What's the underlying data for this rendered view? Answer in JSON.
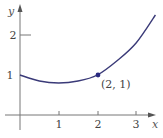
{
  "chart_data": {
    "type": "line",
    "title": "",
    "xlabel": "x",
    "ylabel": "y",
    "x_ticks": [
      "1",
      "2",
      "3"
    ],
    "y_ticks": [
      "1",
      "2"
    ],
    "xlim": [
      0,
      3.7
    ],
    "ylim": [
      0,
      2.6
    ],
    "grid": false,
    "series": [
      {
        "name": "curve",
        "x": [
          0,
          0.5,
          1,
          1.5,
          2,
          2.5,
          3,
          3.5
        ],
        "y": [
          1,
          0.85,
          0.8,
          0.85,
          1,
          1.35,
          1.8,
          2.5
        ]
      }
    ],
    "annotations": [
      {
        "x": 2,
        "y": 1,
        "text": "(2, 1)",
        "marker": "point"
      }
    ],
    "colors": {
      "curve": "#3a3a78",
      "axes": "#777777"
    }
  }
}
